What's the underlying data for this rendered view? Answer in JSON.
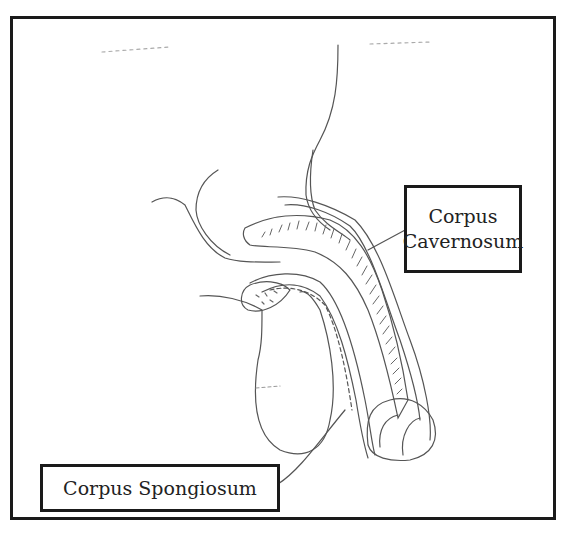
{
  "diagram": {
    "type": "anatomical line drawing",
    "labels": {
      "corpus_cavernosum": {
        "line1": "Corpus",
        "line2": "Cavernosum"
      },
      "corpus_spongiosum": "Corpus Spongiosum"
    },
    "colors": {
      "line": "#555555",
      "border": "#1a1a1a",
      "background": "#ffffff"
    }
  }
}
